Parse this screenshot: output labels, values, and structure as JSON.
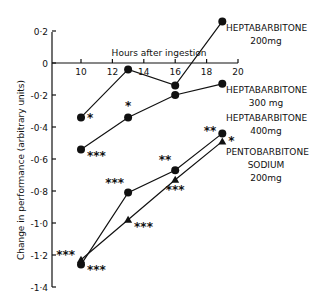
{
  "chart_data": {
    "type": "line",
    "title": "",
    "xlabel": "Hours after ingestion",
    "ylabel": "Change in performance (arbitrary units)",
    "xlim": [
      10,
      20
    ],
    "ylim": [
      -1.4,
      0.2
    ],
    "x_ticks": [
      10,
      12,
      14,
      16,
      18,
      20
    ],
    "x_tick_labels": [
      "10",
      "12",
      "14",
      "16",
      "18",
      "20"
    ],
    "y_ticks": [
      0.2,
      0,
      -0.2,
      -0.4,
      -0.6,
      -0.8,
      -1.0,
      -1.2,
      -1.4
    ],
    "y_tick_labels": [
      "0·2",
      "0",
      "-0·2",
      "-0·4",
      "-0·6",
      "-0·8",
      "-1·0",
      "-1·2",
      "-1·4"
    ],
    "grid": false,
    "legend": "inline labels at right end of each series",
    "series": [
      {
        "name": "HEPTABARBITONE 200mg",
        "label_lines": [
          "HEPTABARBITONE",
          "200mg"
        ],
        "marker": "circle",
        "x": [
          10,
          13,
          16,
          19
        ],
        "values": [
          -0.34,
          -0.04,
          -0.14,
          0.26
        ],
        "significance": [
          "*",
          "",
          "",
          ""
        ]
      },
      {
        "name": "HEPTABARBITONE 300 mg",
        "label_lines": [
          "HEPTABARBITONE",
          "300 mg"
        ],
        "marker": "circle",
        "x": [
          10,
          13,
          16,
          19
        ],
        "values": [
          -0.54,
          -0.34,
          -0.2,
          -0.13
        ],
        "significance": [
          "***",
          "*",
          "",
          ""
        ]
      },
      {
        "name": "HEPTABARBITONE 400mg",
        "label_lines": [
          "HEPTABARBITONE",
          "400mg"
        ],
        "marker": "circle",
        "x": [
          10,
          13,
          16,
          19
        ],
        "values": [
          -1.26,
          -0.81,
          -0.67,
          -0.44
        ],
        "significance": [
          "***",
          "***",
          "**",
          "**"
        ]
      },
      {
        "name": "PENTOBARBITONE SODIUM 200mg",
        "label_lines": [
          "PENTOBARBITONE",
          "SODIUM",
          "200mg"
        ],
        "marker": "triangle",
        "x": [
          10,
          13,
          16,
          19
        ],
        "values": [
          -1.23,
          -0.98,
          -0.73,
          -0.49
        ],
        "significance": [
          "***",
          "***",
          "***",
          "*"
        ]
      }
    ]
  },
  "axes": {
    "x_title": "Hours after ingestion",
    "y_title": "Change in performance (arbitrary units)"
  }
}
